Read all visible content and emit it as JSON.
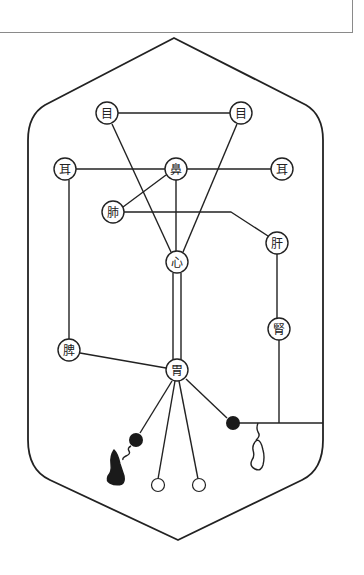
{
  "colors": {
    "stroke": "#222222",
    "fill_dark": "#1a1a1a",
    "background": "#ffffff",
    "box_border": "#8a8a8a"
  },
  "nodes": [
    {
      "id": "eye_left",
      "label": "目",
      "x": 107,
      "y": 113
    },
    {
      "id": "eye_right",
      "label": "目",
      "x": 241,
      "y": 113
    },
    {
      "id": "ear_left",
      "label": "耳",
      "x": 65,
      "y": 169
    },
    {
      "id": "nose",
      "label": "鼻",
      "x": 176,
      "y": 169
    },
    {
      "id": "ear_right",
      "label": "耳",
      "x": 282,
      "y": 169
    },
    {
      "id": "lung",
      "label": "肺",
      "x": 113,
      "y": 212
    },
    {
      "id": "liver",
      "label": "肝",
      "x": 277,
      "y": 243
    },
    {
      "id": "heart",
      "label": "心",
      "x": 177,
      "y": 262
    },
    {
      "id": "kidney",
      "label": "腎",
      "x": 279,
      "y": 329
    },
    {
      "id": "spleen",
      "label": "脾",
      "x": 69,
      "y": 350
    },
    {
      "id": "stomach",
      "label": "胃",
      "x": 177,
      "y": 370
    }
  ],
  "terminals": {
    "filled": [
      {
        "id": "dot_left",
        "x": 136,
        "y": 440
      },
      {
        "id": "dot_right",
        "x": 233,
        "y": 423
      }
    ],
    "open": [
      {
        "id": "open_left",
        "x": 158,
        "y": 485
      },
      {
        "id": "open_right",
        "x": 199,
        "y": 485
      }
    ]
  }
}
